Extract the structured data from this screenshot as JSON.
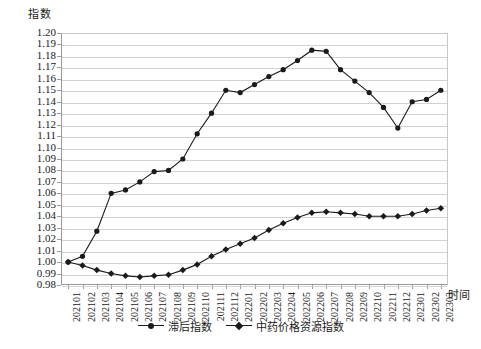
{
  "chart_data": {
    "type": "line",
    "title": "",
    "ylabel": "指数",
    "xlabel": "时间",
    "ylim": [
      0.98,
      1.2
    ],
    "ytick_labels": [
      "1.20",
      "1.19",
      "1.18",
      "1.17",
      "1.16",
      "1.15",
      "1.14",
      "1.13",
      "1.12",
      "1.11",
      "1.10",
      "1.09",
      "1.08",
      "1.07",
      "1.06",
      "1.05",
      "1.04",
      "1.03",
      "1.02",
      "1.01",
      "1.00",
      "0.99",
      "0.98"
    ],
    "grid": true,
    "legend_position": "bottom",
    "categories": [
      "202101",
      "202102",
      "202103",
      "202104",
      "202105",
      "202106",
      "202107",
      "202108",
      "202109",
      "202110",
      "202111",
      "202112",
      "202201",
      "202202",
      "202203",
      "202204",
      "202205",
      "202206",
      "202207",
      "202208",
      "202209",
      "202210",
      "202211",
      "202212",
      "202301",
      "202302",
      "202303"
    ],
    "series": [
      {
        "name": "滞后指数",
        "marker": "circle",
        "color": "#1a1a1a",
        "values": [
          1.0,
          1.005,
          1.027,
          1.06,
          1.063,
          1.07,
          1.079,
          1.08,
          1.09,
          1.112,
          1.13,
          1.15,
          1.148,
          1.155,
          1.162,
          1.168,
          1.176,
          1.185,
          1.184,
          1.168,
          1.158,
          1.148,
          1.135,
          1.117,
          1.14,
          1.142,
          1.15
        ]
      },
      {
        "name": "中药价格资源指数",
        "marker": "diamond",
        "color": "#1a1a1a",
        "values": [
          1.0,
          0.997,
          0.993,
          0.99,
          0.988,
          0.987,
          0.988,
          0.989,
          0.993,
          0.998,
          1.005,
          1.011,
          1.016,
          1.021,
          1.028,
          1.034,
          1.039,
          1.043,
          1.044,
          1.043,
          1.042,
          1.04,
          1.04,
          1.04,
          1.042,
          1.045,
          1.047
        ]
      }
    ]
  },
  "legend": {
    "items": [
      {
        "label": "滞后指数"
      },
      {
        "label": "中药价格资源指数"
      }
    ]
  },
  "caption": {
    "text": ""
  }
}
